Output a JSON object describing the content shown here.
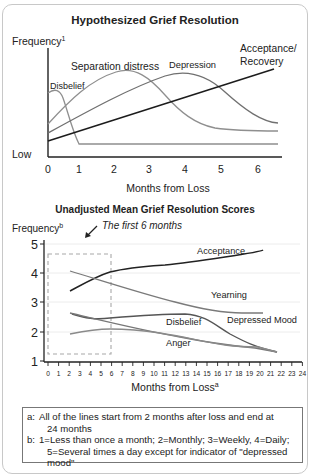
{
  "chart_data": [
    {
      "type": "line",
      "title": "Hypothesized Grief Resolution",
      "ylabel": "Frequency",
      "ylabel_superscript": "1",
      "y_low_label": "Low",
      "xlabel": "Months from Loss",
      "x_ticks": [
        "0",
        "1",
        "2",
        "3",
        "4",
        "5",
        "6"
      ],
      "xlim": [
        0,
        6.5
      ],
      "grid": false,
      "legend": "inline labels",
      "series": [
        {
          "name": "Disbelief",
          "color": "#8a8a8a",
          "x": [
            0,
            0.3,
            0.5,
            0.9,
            6.5
          ],
          "y": [
            0.85,
            0.88,
            0.8,
            0.12,
            0.12
          ]
        },
        {
          "name": "Separation distress",
          "color": "#8a8a8a",
          "x": [
            0,
            0.5,
            1,
            2,
            3,
            4,
            5,
            6.5
          ],
          "y": [
            0.35,
            0.6,
            0.8,
            1.0,
            0.75,
            0.4,
            0.25,
            0.22
          ]
        },
        {
          "name": "Depression",
          "color": "#6e6e6e",
          "x": [
            0,
            1,
            2,
            3,
            4,
            5,
            6.5
          ],
          "y": [
            0.25,
            0.5,
            0.75,
            0.92,
            1.0,
            0.75,
            0.28
          ]
        },
        {
          "name": "Acceptance/ Recovery",
          "color": "#222222",
          "x": [
            0,
            6.2
          ],
          "y": [
            0.15,
            0.97
          ]
        }
      ]
    },
    {
      "type": "line",
      "title": "Unadjusted Mean Grief Resolution Scores",
      "ylabel": "Frequency",
      "ylabel_superscript": "b",
      "xlabel": "Months from Loss",
      "xlabel_superscript": "a",
      "x_ticks": [
        "0",
        "1",
        "2",
        "3",
        "4",
        "5",
        "6",
        "7",
        "8",
        "9",
        "10",
        "11",
        "12",
        "13",
        "14",
        "15",
        "16",
        "17",
        "18",
        "19",
        "20",
        "21",
        "22",
        "23",
        "24"
      ],
      "y_ticks": [
        "1",
        "2",
        "3",
        "4",
        "5"
      ],
      "ylim": [
        1,
        5.1
      ],
      "xlim": [
        0,
        24
      ],
      "grid": true,
      "annotation": {
        "text": "The first 6 months",
        "box_x": [
          0,
          6
        ],
        "box_y": [
          1.35,
          4.7
        ]
      },
      "series": [
        {
          "name": "Acceptance",
          "color": "#222222",
          "x": [
            2,
            4,
            6,
            9,
            12,
            14,
            16,
            18,
            20,
            22
          ],
          "y": [
            3.4,
            3.75,
            3.95,
            4.1,
            4.15,
            4.25,
            4.4,
            4.55,
            4.68,
            4.8
          ]
        },
        {
          "name": "Yearning",
          "color": "#777777",
          "x": [
            2,
            6,
            10,
            14,
            18,
            20,
            22
          ],
          "y": [
            4.1,
            3.75,
            3.4,
            3.1,
            2.8,
            2.78,
            2.78
          ]
        },
        {
          "name": "Depressed Mood",
          "color": "#555555",
          "x": [
            2,
            4,
            6,
            9,
            12,
            14,
            16,
            18,
            20,
            22
          ],
          "y": [
            2.62,
            2.45,
            2.5,
            2.55,
            2.6,
            2.55,
            2.3,
            2.05,
            1.75,
            1.6
          ]
        },
        {
          "name": "Disbelief",
          "color": "#777777",
          "x": [
            2,
            6,
            10,
            14,
            18,
            20,
            22
          ],
          "y": [
            2.65,
            2.45,
            2.25,
            2.05,
            1.8,
            1.72,
            1.6
          ]
        },
        {
          "name": "Anger",
          "color": "#888888",
          "x": [
            2,
            4,
            6,
            9,
            12,
            15,
            18,
            20,
            22
          ],
          "y": [
            1.92,
            2.05,
            2.05,
            2.03,
            1.92,
            1.82,
            1.7,
            1.7,
            1.6
          ]
        }
      ]
    }
  ],
  "top_chart": {
    "title": "Hypothesized Grief Resolution",
    "ylabel": "Frequency",
    "ylabel_sup": "1",
    "low_label": "Low",
    "xlabel": "Months from Loss",
    "labels": {
      "disbelief": "Disbelief",
      "separation": "Separation distress",
      "depression": "Depression",
      "acceptance_1": "Acceptance/",
      "acceptance_2": "Recovery"
    }
  },
  "bottom_chart": {
    "title": "Unadjusted Mean Grief Resolution Scores",
    "ylabel": "Frequency",
    "ylabel_sup": "b",
    "xlabel": "Months from Loss",
    "xlabel_sup": "a",
    "annotation": "The first 6 months",
    "labels": {
      "acceptance": "Acceptance",
      "yearning": "Yearning",
      "disbelief": "Disbelief",
      "depressed": "Depressed Mood",
      "anger": "Anger"
    }
  },
  "notes": {
    "a_key": "a:",
    "a_line1": "All of the lines start from 2 months after loss and end at",
    "a_line2": "24 months",
    "b_key": "b:",
    "b_line1": "1=Less than once a month; 2=Monthly; 3=Weekly, 4=Daily;",
    "b_line2": "5=Several times a day except for indicator of \"depressed mood\""
  }
}
